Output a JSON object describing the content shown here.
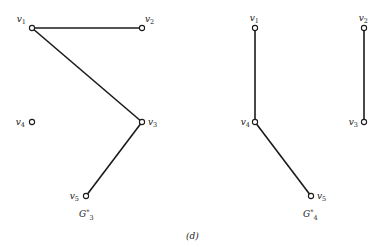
{
  "figure_label": "(d)",
  "graphs": [
    {
      "name": "G*3",
      "title_main": "G",
      "title_sup": "*",
      "title_sub": "3",
      "nodes": [
        {
          "id": "v1",
          "base": "v",
          "sub": "1"
        },
        {
          "id": "v2",
          "base": "v",
          "sub": "2"
        },
        {
          "id": "v3",
          "base": "v",
          "sub": "3"
        },
        {
          "id": "v4",
          "base": "v",
          "sub": "4"
        },
        {
          "id": "v5",
          "base": "v",
          "sub": "5"
        }
      ],
      "edges": [
        [
          "v1",
          "v2"
        ],
        [
          "v1",
          "v3"
        ],
        [
          "v3",
          "v5"
        ]
      ]
    },
    {
      "name": "G*4",
      "title_main": "G",
      "title_sup": "*",
      "title_sub": "4",
      "nodes": [
        {
          "id": "v1",
          "base": "v",
          "sub": "1"
        },
        {
          "id": "v2",
          "base": "v",
          "sub": "2"
        },
        {
          "id": "v3",
          "base": "v",
          "sub": "3"
        },
        {
          "id": "v4",
          "base": "v",
          "sub": "4"
        },
        {
          "id": "v5",
          "base": "v",
          "sub": "5"
        }
      ],
      "edges": [
        [
          "v1",
          "v4"
        ],
        [
          "v2",
          "v3"
        ],
        [
          "v4",
          "v5"
        ]
      ]
    }
  ]
}
